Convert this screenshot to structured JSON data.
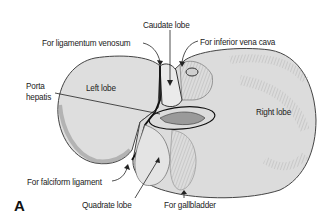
{
  "figure": {
    "panel_label": "A",
    "colors": {
      "organ_fill": "#dcdcdc",
      "shading": "#8a8a8a",
      "outline": "#333333",
      "text": "#222222"
    },
    "labels": {
      "caudate_lobe": "Caudate lobe",
      "ligamentum_venosum": "For ligamentum venosum",
      "inferior_vena_cava": "For inferior vena cava",
      "porta_hepatis_line1": "Porta",
      "porta_hepatis_line2": "hepatis",
      "left_lobe": "Left lobe",
      "right_lobe": "Right lobe",
      "falciform_ligament": "For falciform ligament",
      "quadrate_lobe": "Quadrate lobe",
      "gallbladder": "For gallbladder"
    }
  }
}
